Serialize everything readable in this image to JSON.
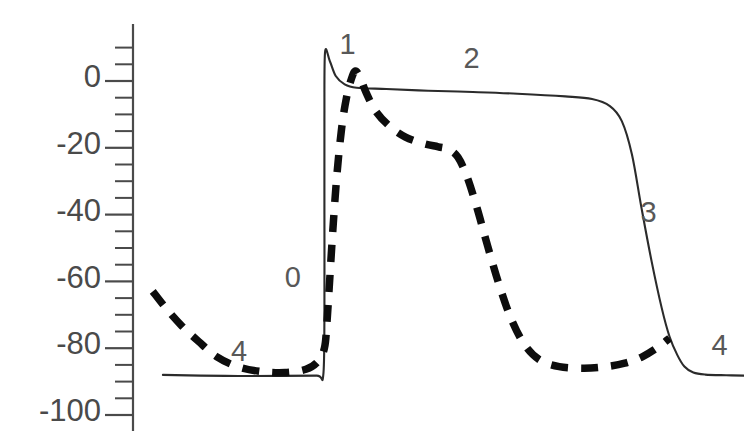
{
  "chart_data": {
    "type": "line",
    "title": "",
    "xlabel": "",
    "ylabel": "",
    "ylim": [
      -100,
      10
    ],
    "xlim": [
      0,
      1
    ],
    "grid": false,
    "legend": null,
    "y_ticks_major": [
      0,
      -20,
      -40,
      -60,
      -80,
      -100
    ],
    "y_tick_labels": [
      "0",
      "-20",
      "-40",
      "-60",
      "-80",
      "-100"
    ],
    "y_minor_tick_interval": 5,
    "axis_position": "left",
    "x_axis_visible": false,
    "annotations": [
      {
        "text": "0",
        "x": 0.243,
        "y": -59.5
      },
      {
        "text": "1",
        "x": 0.335,
        "y": 10.5
      },
      {
        "text": "2",
        "x": 0.543,
        "y": 6.2
      },
      {
        "text": "3",
        "x": 0.84,
        "y": -40.0
      },
      {
        "text": "4",
        "x": 0.153,
        "y": -81.5
      },
      {
        "text": "4",
        "x": 0.959,
        "y": -79.8
      }
    ],
    "series": [
      {
        "name": "solid",
        "style": "solid",
        "color": "#2b2b2b",
        "points": [
          [
            0.025,
            -88.0
          ],
          [
            0.13,
            -88.3
          ],
          [
            0.225,
            -88.3
          ],
          [
            0.283,
            -88.2
          ],
          [
            0.294,
            -88.2
          ],
          [
            0.296,
            -70.0
          ],
          [
            0.296,
            -40.0
          ],
          [
            0.296,
            -12.0
          ],
          [
            0.297,
            8.5
          ],
          [
            0.305,
            6.0
          ],
          [
            0.315,
            1.5
          ],
          [
            0.33,
            -1.0
          ],
          [
            0.35,
            -2.0
          ],
          [
            0.4,
            -2.4
          ],
          [
            0.47,
            -2.9
          ],
          [
            0.545,
            -3.3
          ],
          [
            0.62,
            -3.8
          ],
          [
            0.7,
            -4.6
          ],
          [
            0.745,
            -5.4
          ],
          [
            0.775,
            -7.5
          ],
          [
            0.795,
            -12.0
          ],
          [
            0.812,
            -22.0
          ],
          [
            0.828,
            -38.0
          ],
          [
            0.845,
            -54.0
          ],
          [
            0.862,
            -68.0
          ],
          [
            0.875,
            -76.5
          ],
          [
            0.888,
            -82.0
          ],
          [
            0.9,
            -85.5
          ],
          [
            0.915,
            -87.3
          ],
          [
            0.935,
            -87.9
          ],
          [
            0.97,
            -88.1
          ],
          [
            1.0,
            -88.2
          ]
        ]
      },
      {
        "name": "dashed",
        "style": "dashed",
        "color": "#0d0d0d",
        "points": [
          [
            0.008,
            -63.0
          ],
          [
            0.03,
            -68.0
          ],
          [
            0.055,
            -73.0
          ],
          [
            0.085,
            -78.0
          ],
          [
            0.115,
            -82.5
          ],
          [
            0.15,
            -85.5
          ],
          [
            0.19,
            -87.0
          ],
          [
            0.23,
            -87.3
          ],
          [
            0.265,
            -86.3
          ],
          [
            0.285,
            -84.0
          ],
          [
            0.296,
            -80.0
          ],
          [
            0.3,
            -73.0
          ],
          [
            0.304,
            -62.0
          ],
          [
            0.31,
            -45.0
          ],
          [
            0.317,
            -28.0
          ],
          [
            0.325,
            -14.0
          ],
          [
            0.333,
            -5.0
          ],
          [
            0.341,
            0.5
          ],
          [
            0.348,
            3.0
          ],
          [
            0.356,
            1.0
          ],
          [
            0.366,
            -3.5
          ],
          [
            0.382,
            -9.0
          ],
          [
            0.405,
            -13.5
          ],
          [
            0.432,
            -16.8
          ],
          [
            0.462,
            -18.7
          ],
          [
            0.487,
            -19.7
          ],
          [
            0.505,
            -20.5
          ],
          [
            0.52,
            -22.8
          ],
          [
            0.535,
            -28.5
          ],
          [
            0.552,
            -38.0
          ],
          [
            0.57,
            -49.5
          ],
          [
            0.59,
            -61.5
          ],
          [
            0.61,
            -71.5
          ],
          [
            0.632,
            -79.0
          ],
          [
            0.657,
            -83.5
          ],
          [
            0.69,
            -85.5
          ],
          [
            0.73,
            -86.0
          ],
          [
            0.765,
            -85.6
          ],
          [
            0.8,
            -84.5
          ],
          [
            0.83,
            -82.5
          ],
          [
            0.855,
            -79.8
          ],
          [
            0.875,
            -77.0
          ]
        ]
      }
    ]
  },
  "figure": {
    "background_color": "#ffffff",
    "axis_color": "#4a4a4a",
    "label_color": "#585858"
  }
}
